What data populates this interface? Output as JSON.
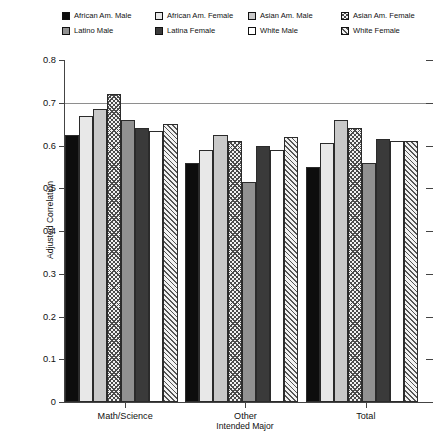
{
  "chart_data": {
    "type": "bar",
    "title": "",
    "xlabel": "Intended Major",
    "ylabel": "Adjusted Correlation",
    "categories": [
      "Math/Science",
      "Other",
      "Total"
    ],
    "ylim": [
      0,
      0.8
    ],
    "ytick_values": [
      0,
      0.1,
      0.2,
      0.3,
      0.4,
      0.5,
      0.6,
      0.7,
      0.8
    ],
    "ytick_labels": [
      "0",
      "0.1",
      "0.2",
      "0.3",
      "0.4",
      "0.5",
      "0.6",
      "0.7",
      "0.8"
    ],
    "grid": "horizontal-at-0.7",
    "gridline_values": [
      0.7
    ],
    "legend_position": "top",
    "series": [
      {
        "name": "African Am. Male",
        "fill": "solid-black",
        "swatch_class": "f-black",
        "values": [
          0.625,
          0.56,
          0.55
        ]
      },
      {
        "name": "African Am. Female",
        "fill": "very-light-gray",
        "swatch_class": "f-vlight",
        "values": [
          0.67,
          0.59,
          0.605
        ]
      },
      {
        "name": "Asian Am. Male",
        "fill": "light-gray",
        "swatch_class": "f-light",
        "values": [
          0.685,
          0.625,
          0.66
        ]
      },
      {
        "name": "Asian Am. Female",
        "fill": "crosshatch",
        "swatch_class": "f-cross",
        "values": [
          0.72,
          0.61,
          0.64
        ]
      },
      {
        "name": "Latino Male",
        "fill": "medium-gray",
        "swatch_class": "f-medium",
        "values": [
          0.66,
          0.515,
          0.56
        ]
      },
      {
        "name": "Latina Female",
        "fill": "dark-gray",
        "swatch_class": "f-dark",
        "values": [
          0.64,
          0.6,
          0.615
        ]
      },
      {
        "name": "White Male",
        "fill": "white",
        "swatch_class": "f-white",
        "values": [
          0.635,
          0.59,
          0.61
        ]
      },
      {
        "name": "White Female",
        "fill": "diagonal-hatch",
        "swatch_class": "f-diag",
        "values": [
          0.65,
          0.62,
          0.61
        ]
      }
    ]
  },
  "colors": {
    "axis": "#444444",
    "gridline": "#8e8e8e",
    "bar_outline": "#2b2b2b",
    "background": "#ffffff",
    "text": "#111111"
  }
}
